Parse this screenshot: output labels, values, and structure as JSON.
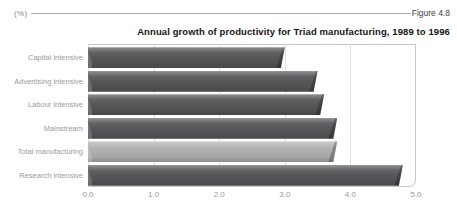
{
  "figure": {
    "unit_label": "(%)",
    "figure_label": "Figure 4.8",
    "title": "Annual growth of productivity for Triad manufacturing, 1989 to 1996"
  },
  "chart_data": {
    "type": "bar",
    "orientation": "horizontal",
    "title": "Annual growth of productivity for Triad manufacturing, 1989 to 1996",
    "unit": "%",
    "categories": [
      "Capital intensive",
      "Advertising intensive",
      "Labour intensive",
      "Mainstream",
      "Total manufacturing",
      "Research intensive"
    ],
    "values": [
      3.0,
      3.5,
      3.6,
      3.8,
      3.8,
      4.8
    ],
    "xlim": [
      0,
      5
    ],
    "x_ticks": [
      "0.0",
      "1.0",
      "2.0",
      "3.0",
      "4.0",
      "5.0"
    ],
    "grid": true,
    "legend": "none",
    "highlighted_category": "Total manufacturing",
    "bar_color_default": "#57575a",
    "bar_color_highlight": "#b0b0b1"
  },
  "colors": {
    "background": "#ffffff",
    "grid_line": "#dedede",
    "plot_border": "#c9c9c9",
    "text_muted": "#9a9a9a",
    "text_dark": "#161616"
  }
}
